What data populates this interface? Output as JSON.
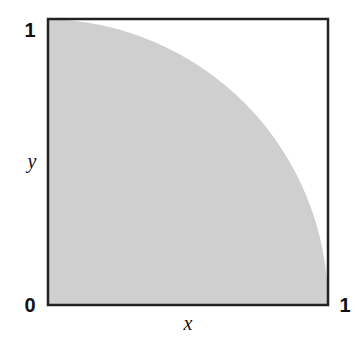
{
  "diagram": {
    "x_axis": {
      "label": "x",
      "min_label": "0",
      "max_label": "1"
    },
    "y_axis": {
      "label": "y",
      "max_label": "1"
    },
    "region": {
      "shape": "quarter-circle",
      "description": "x^2 + y^2 <= 1 in unit square",
      "fill": "#cfcfcf"
    },
    "frame_color": "#222222"
  }
}
